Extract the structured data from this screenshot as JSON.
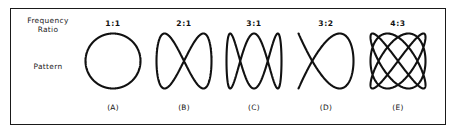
{
  "figure": {
    "row_labels": {
      "frequency_ratio": "Frequency\nRatio",
      "pattern": "Pattern"
    },
    "stroke_color": "#111111",
    "frame_color": "#1a1a1a",
    "background_color": "#ffffff",
    "columns": [
      {
        "ratio": "1:1",
        "panel": "(A)",
        "curve_name": "circle",
        "fx": 1,
        "fy": 1,
        "phase_deg": 90
      },
      {
        "ratio": "2:1",
        "panel": "(B)",
        "curve_name": "figure-eight",
        "fx": 1,
        "fy": 2,
        "phase_deg": 90
      },
      {
        "ratio": "3:1",
        "panel": "(C)",
        "curve_name": "three-lobe",
        "fx": 1,
        "fy": 3,
        "phase_deg": 90
      },
      {
        "ratio": "3:2",
        "panel": "(D)",
        "curve_name": "three-two-lattice",
        "fx": 2,
        "fy": 3,
        "phase_deg": 90
      },
      {
        "ratio": "4:3",
        "panel": "(E)",
        "curve_name": "four-three-lattice",
        "fx": 3,
        "fy": 4,
        "phase_deg": 90
      }
    ]
  }
}
